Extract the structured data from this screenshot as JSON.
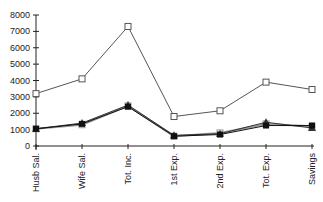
{
  "chart_data": {
    "type": "line",
    "title": "",
    "xlabel": "",
    "ylabel": "",
    "ylim": [
      0,
      8000
    ],
    "yticks": [
      0,
      1000,
      2000,
      3000,
      4000,
      5000,
      6000,
      7000,
      8000
    ],
    "grid": false,
    "legend": null,
    "categories": [
      "Husb Sal.",
      "Wife Sal.",
      "Tot. Inc.",
      "1st Exp.",
      "2nd Exp.",
      "Tot. Exp.",
      "Savings"
    ],
    "series": [
      {
        "name": "Series 1",
        "marker": "open-square",
        "color": "#555555",
        "values": [
          3200,
          4100,
          7300,
          1800,
          2150,
          3900,
          3450
        ]
      },
      {
        "name": "Series 2",
        "marker": "filled-square",
        "color": "#111111",
        "values": [
          1050,
          1350,
          2400,
          600,
          700,
          1250,
          1250
        ]
      },
      {
        "name": "Series 3",
        "marker": "triangle",
        "color": "#333333",
        "values": [
          1050,
          1400,
          2500,
          650,
          750,
          1450,
          1100
        ]
      },
      {
        "name": "Series 4",
        "marker": "open-square",
        "color": "#999999",
        "values": [
          1050,
          1300,
          2450,
          600,
          800,
          1350,
          1200
        ]
      }
    ]
  }
}
